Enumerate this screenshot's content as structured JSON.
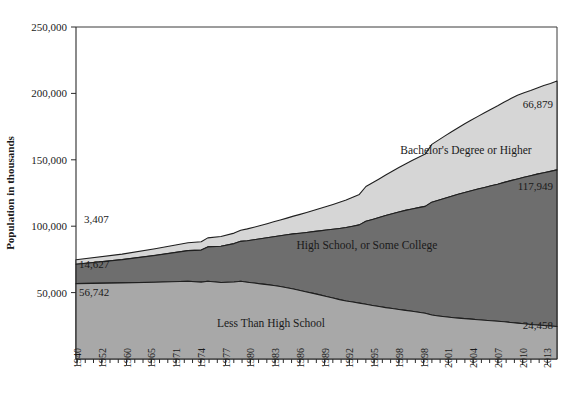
{
  "chart_data": {
    "type": "area",
    "stacked": true,
    "title": "",
    "xlabel": "",
    "ylabel": "Population in thousands",
    "ylim": [
      0,
      250000
    ],
    "yticks": [
      50000,
      100000,
      150000,
      200000,
      250000
    ],
    "ytick_labels": [
      "50,000",
      "100,000",
      "150,000",
      "200,000",
      "250,000"
    ],
    "grid": false,
    "legend_position": "inline-annotations",
    "x_axis_tick_labels": [
      "1940",
      "1952",
      "1960",
      "1965",
      "1971",
      "1974",
      "1977",
      "1980",
      "1983",
      "1986",
      "1989",
      "1992",
      "1995",
      "1998",
      "1998",
      "2001",
      "2004",
      "2007",
      "2010",
      "2013"
    ],
    "x": [
      1940,
      1947,
      1952,
      1957,
      1959,
      1960,
      1962,
      1964,
      1965,
      1966,
      1967,
      1968,
      1969,
      1970,
      1971,
      1972,
      1973,
      1974,
      1975,
      1976,
      1977,
      1978,
      1979,
      1980,
      1981,
      1982,
      1983,
      1984,
      1985,
      1986,
      1987,
      1988,
      1989,
      1990,
      1991,
      1992,
      1993,
      1994,
      1995,
      1996,
      1997,
      1998,
      1999,
      2000,
      2001,
      2002,
      2003,
      2004,
      2005,
      2006,
      2007,
      2008,
      2009,
      2010,
      2011,
      2012,
      2013
    ],
    "series": [
      {
        "name": "Less Than High School",
        "color": "#a8a8a8",
        "start_value": 56742,
        "end_value": 24458,
        "values": [
          56742,
          57300,
          57800,
          58600,
          57900,
          58600,
          57600,
          58000,
          58500,
          57800,
          57200,
          56600,
          56000,
          55400,
          54600,
          53700,
          52700,
          51600,
          50500,
          49400,
          48300,
          47100,
          45900,
          44700,
          43700,
          42900,
          42100,
          41200,
          40300,
          39500,
          38700,
          38000,
          37300,
          36600,
          35900,
          35200,
          34500,
          33100,
          32400,
          31800,
          31300,
          30800,
          30400,
          30000,
          29600,
          29200,
          28800,
          28400,
          28000,
          27500,
          27000,
          26500,
          26000,
          25600,
          25200,
          24800,
          24458
        ]
      },
      {
        "name": "High School, or Some College",
        "color": "#6e6e6e",
        "start_value": 14627,
        "end_value": 117949,
        "values": [
          14627,
          17500,
          20200,
          23000,
          24100,
          25800,
          27300,
          28900,
          30100,
          31300,
          32600,
          33900,
          35300,
          36700,
          38200,
          39800,
          41500,
          43100,
          44800,
          46500,
          48200,
          50000,
          51800,
          53600,
          55300,
          57100,
          58900,
          62500,
          64800,
          67100,
          69300,
          71400,
          73400,
          75300,
          77100,
          78800,
          80400,
          85000,
          87200,
          89300,
          91300,
          93200,
          95000,
          96700,
          98400,
          100000,
          101600,
          103200,
          105000,
          106800,
          108600,
          110400,
          112000,
          113600,
          115100,
          116500,
          117949
        ]
      },
      {
        "name": "Bachelor's Degree or Higher",
        "color": "#d6d6d6",
        "start_value": 3407,
        "end_value": 66879,
        "values": [
          3407,
          4200,
          5000,
          5900,
          6300,
          6800,
          7300,
          7900,
          8400,
          8900,
          9400,
          10000,
          10600,
          11200,
          11900,
          12600,
          13400,
          14200,
          15000,
          15900,
          16800,
          17700,
          18700,
          19700,
          20700,
          21800,
          22900,
          26200,
          27600,
          29000,
          30500,
          32000,
          33500,
          35000,
          36500,
          38000,
          39400,
          43500,
          45200,
          46900,
          48500,
          50100,
          51700,
          53200,
          54700,
          56200,
          57700,
          59100,
          60500,
          61800,
          63000,
          63600,
          64200,
          64900,
          65600,
          66200,
          66879
        ]
      }
    ],
    "value_annotations": {
      "left": [
        {
          "label": "3,407",
          "series": "Bachelor's Degree or Higher"
        },
        {
          "label": "14,627",
          "series": "High School, or Some College"
        },
        {
          "label": "56,742",
          "series": "Less Than High School"
        }
      ],
      "right": [
        {
          "label": "66,879",
          "series": "Bachelor's Degree or Higher"
        },
        {
          "label": "117,949",
          "series": "High School, or Some College"
        },
        {
          "label": "24,458",
          "series": "Less Than High School"
        }
      ]
    },
    "inline_series_labels": [
      "Bachelor's Degree or Higher",
      "High School, or Some College",
      "Less Than High School"
    ]
  }
}
